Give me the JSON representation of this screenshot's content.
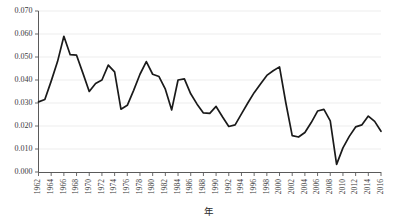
{
  "chart_data": {
    "type": "line",
    "title": "",
    "subtitle": "",
    "xlabel": "年",
    "ylabel": "",
    "grid": true,
    "legend": null,
    "legend_position": "none",
    "xlim": [
      1962,
      2016
    ],
    "ylim": [
      0.0,
      0.07
    ],
    "y_tick_labels": [
      "0.000",
      "0.010",
      "0.020",
      "0.030",
      "0.040",
      "0.050",
      "0.060",
      "0.070"
    ],
    "y_tick_values": [
      0.0,
      0.01,
      0.02,
      0.03,
      0.04,
      0.05,
      0.06,
      0.07
    ],
    "x_tick_labels": [
      "1962",
      "1964",
      "1966",
      "1968",
      "1970",
      "1972",
      "1974",
      "1976",
      "1978",
      "1980",
      "1982",
      "1984",
      "1986",
      "1988",
      "1990",
      "1992",
      "1994",
      "1996",
      "1998",
      "2000",
      "2002",
      "2004",
      "2006",
      "2008",
      "2010",
      "2012",
      "2014",
      "2016"
    ],
    "x_tick_values": [
      1962,
      1964,
      1966,
      1968,
      1970,
      1972,
      1974,
      1976,
      1978,
      1980,
      1982,
      1984,
      1986,
      1988,
      1990,
      1992,
      1994,
      1996,
      1998,
      2000,
      2002,
      2004,
      2006,
      2008,
      2010,
      2012,
      2014,
      2016
    ],
    "x_tick_rotation": -90,
    "x": [
      1962,
      1963,
      1964,
      1965,
      1966,
      1967,
      1968,
      1969,
      1970,
      1971,
      1972,
      1973,
      1974,
      1975,
      1976,
      1977,
      1978,
      1979,
      1980,
      1981,
      1982,
      1983,
      1984,
      1985,
      1986,
      1987,
      1988,
      1989,
      1990,
      1991,
      1992,
      1993,
      1994,
      1995,
      1996,
      1997,
      1998,
      1999,
      2000,
      2001,
      2002,
      2003,
      2004,
      2005,
      2006,
      2007,
      2008,
      2009,
      2010,
      2011,
      2012,
      2013,
      2014,
      2015,
      2016
    ],
    "series": [
      {
        "name": "",
        "color": "#1a1a1a",
        "values": [
          0.0305,
          0.0315,
          0.0395,
          0.048,
          0.059,
          0.051,
          0.0508,
          0.043,
          0.035,
          0.0385,
          0.04,
          0.0465,
          0.0435,
          0.0273,
          0.029,
          0.0355,
          0.0425,
          0.048,
          0.0425,
          0.0415,
          0.036,
          0.027,
          0.04,
          0.0405,
          0.034,
          0.0295,
          0.0257,
          0.0255,
          0.0285,
          0.024,
          0.0198,
          0.0205,
          0.0253,
          0.03,
          0.0345,
          0.0383,
          0.042,
          0.044,
          0.0457,
          0.03,
          0.0158,
          0.0152,
          0.0172,
          0.0215,
          0.0265,
          0.0272,
          0.0222,
          0.0033,
          0.0105,
          0.0155,
          0.0196,
          0.0205,
          0.0243,
          0.022,
          0.0177
        ]
      }
    ]
  }
}
